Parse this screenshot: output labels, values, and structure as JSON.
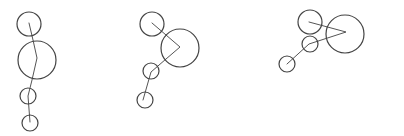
{
  "diagram": {
    "background": "#ffffff",
    "stroke_color": "#444444",
    "figures": [
      {
        "id": "figure-1",
        "nodes": [
          {
            "cx": 29,
            "cy": 24,
            "r": 12
          },
          {
            "cx": 37,
            "cy": 60,
            "r": 19
          },
          {
            "cx": 28,
            "cy": 96,
            "r": 8
          },
          {
            "cx": 30,
            "cy": 123,
            "r": 8
          }
        ],
        "path": [
          [
            29,
            23
          ],
          [
            33,
            40
          ],
          [
            37,
            58
          ],
          [
            32,
            80
          ],
          [
            28,
            96
          ],
          [
            30,
            122
          ]
        ]
      },
      {
        "id": "figure-2",
        "nodes": [
          {
            "cx": 152,
            "cy": 24,
            "r": 12
          },
          {
            "cx": 180,
            "cy": 48,
            "r": 19
          },
          {
            "cx": 151,
            "cy": 71,
            "r": 8
          },
          {
            "cx": 145,
            "cy": 100,
            "r": 8
          }
        ],
        "path": [
          [
            152,
            23
          ],
          [
            166,
            35
          ],
          [
            180,
            47
          ],
          [
            166,
            59
          ],
          [
            151,
            72
          ],
          [
            143,
            100
          ]
        ]
      },
      {
        "id": "figure-3",
        "nodes": [
          {
            "cx": 310,
            "cy": 22,
            "r": 12
          },
          {
            "cx": 345,
            "cy": 34,
            "r": 19
          },
          {
            "cx": 310,
            "cy": 44,
            "r": 8
          },
          {
            "cx": 287,
            "cy": 64,
            "r": 8
          }
        ],
        "path": [
          [
            309,
            22
          ],
          [
            346,
            32
          ],
          [
            309,
            44
          ],
          [
            287,
            64
          ]
        ]
      }
    ]
  }
}
